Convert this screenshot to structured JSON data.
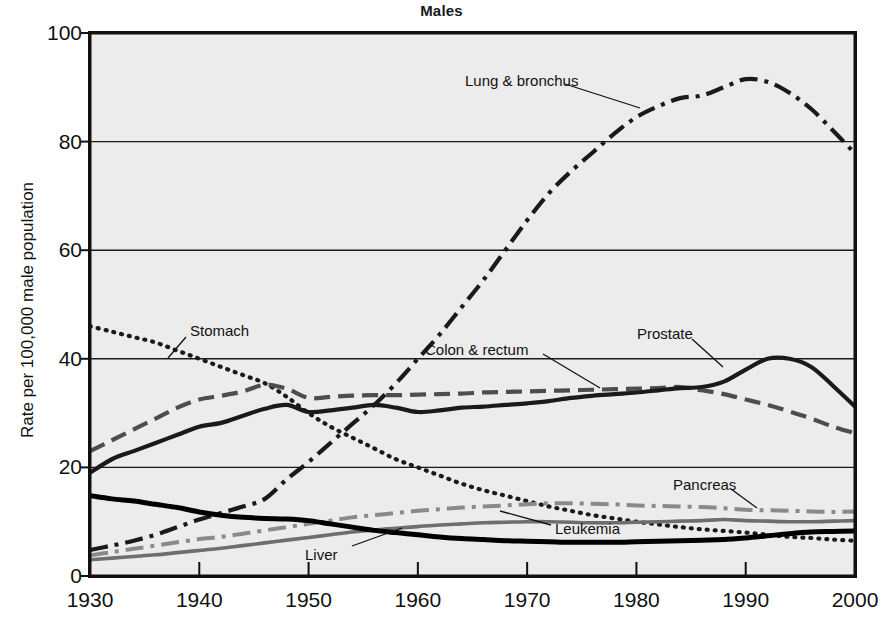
{
  "chart": {
    "title": "Males",
    "ylabel": "Rate per 100,000 male population",
    "xlabel": "",
    "background": "#ececec",
    "frame_color": "#111111"
  },
  "axis": {
    "y_ticks": [
      "0",
      "20",
      "40",
      "60",
      "80",
      "100"
    ],
    "x_ticks": [
      "1930",
      "1940",
      "1950",
      "1960",
      "1970",
      "1980",
      "1990",
      "2000"
    ]
  },
  "labels": {
    "lung": "Lung & bronchus",
    "stomach": "Stomach",
    "colon": "Colon & rectum",
    "prostate": "Prostate",
    "pancreas": "Pancreas",
    "leukemia": "Leukemia",
    "liver": "Liver"
  },
  "chart_data": {
    "type": "line",
    "title": "Males",
    "xlabel": "",
    "ylabel": "Rate per 100,000 male population",
    "xlim": [
      1930,
      2000
    ],
    "ylim": [
      0,
      100
    ],
    "grid": "horizontal",
    "legend": "inline-annotations",
    "x": [
      1930,
      1932,
      1934,
      1936,
      1938,
      1940,
      1942,
      1944,
      1946,
      1948,
      1950,
      1952,
      1954,
      1956,
      1958,
      1960,
      1962,
      1964,
      1966,
      1968,
      1970,
      1972,
      1974,
      1976,
      1978,
      1980,
      1982,
      1984,
      1986,
      1988,
      1990,
      1992,
      1994,
      1996,
      1998,
      2000
    ],
    "series": [
      {
        "name": "Lung & bronchus",
        "color": "#1a1a1a",
        "dash": "dash-dot",
        "width": 4.2,
        "values": [
          4.8,
          5.6,
          6.5,
          7.6,
          9.0,
          10.4,
          11.6,
          12.8,
          14.2,
          17.8,
          21.0,
          24.5,
          28.0,
          31.5,
          35.5,
          40.0,
          44.5,
          49.5,
          54.5,
          60.0,
          65.5,
          70.5,
          74.5,
          78.0,
          81.5,
          84.5,
          86.5,
          88.0,
          88.5,
          90.0,
          91.5,
          91.0,
          89.0,
          86.0,
          82.0,
          77.8
        ]
      },
      {
        "name": "Stomach",
        "color": "#1a1a1a",
        "dash": "dotted",
        "width": 4.2,
        "values": [
          46.0,
          45.0,
          44.0,
          43.0,
          41.5,
          40.0,
          38.5,
          37.0,
          35.5,
          33.0,
          30.0,
          27.5,
          25.5,
          23.5,
          21.5,
          20.0,
          18.5,
          17.0,
          15.8,
          14.8,
          13.8,
          12.8,
          12.0,
          11.2,
          10.6,
          10.0,
          9.5,
          9.0,
          8.6,
          8.3,
          8.0,
          7.6,
          7.2,
          7.0,
          6.7,
          6.5
        ]
      },
      {
        "name": "Colon & rectum",
        "color": "#4d4d4d",
        "dash": "long-dash",
        "width": 4.2,
        "values": [
          23.0,
          25.0,
          27.0,
          29.0,
          31.0,
          32.5,
          33.2,
          34.0,
          35.2,
          34.5,
          32.8,
          33.0,
          33.2,
          33.3,
          33.3,
          33.4,
          33.5,
          33.6,
          33.8,
          33.9,
          34.0,
          34.1,
          34.2,
          34.3,
          34.4,
          34.5,
          34.6,
          34.8,
          34.2,
          33.5,
          32.5,
          31.5,
          30.3,
          29.0,
          27.5,
          26.3
        ]
      },
      {
        "name": "Prostate",
        "color": "#1a1a1a",
        "dash": "solid",
        "width": 4.2,
        "values": [
          19.0,
          21.5,
          23.0,
          24.5,
          26.0,
          27.5,
          28.2,
          29.5,
          30.8,
          31.5,
          30.2,
          30.5,
          31.0,
          31.5,
          31.0,
          30.2,
          30.5,
          31.0,
          31.2,
          31.5,
          31.8,
          32.2,
          32.8,
          33.2,
          33.5,
          33.8,
          34.2,
          34.6,
          34.8,
          35.8,
          38.0,
          40.0,
          40.0,
          38.5,
          35.0,
          31.2
        ]
      },
      {
        "name": "Pancreas",
        "color": "#8a8a8a",
        "dash": "dash-dot",
        "width": 4.0,
        "values": [
          3.8,
          4.4,
          5.0,
          5.6,
          6.2,
          6.8,
          7.2,
          7.8,
          8.4,
          9.0,
          9.6,
          10.2,
          10.8,
          11.2,
          11.6,
          12.0,
          12.3,
          12.6,
          12.8,
          13.0,
          13.2,
          13.4,
          13.4,
          13.3,
          13.2,
          13.0,
          12.9,
          12.8,
          12.7,
          12.5,
          12.2,
          12.1,
          12.0,
          11.9,
          11.8,
          11.9
        ]
      },
      {
        "name": "Leukemia",
        "color": "#6e6e6e",
        "dash": "solid",
        "width": 3.6,
        "values": [
          3.0,
          3.3,
          3.6,
          3.9,
          4.3,
          4.7,
          5.1,
          5.6,
          6.1,
          6.6,
          7.1,
          7.6,
          8.1,
          8.5,
          8.8,
          9.1,
          9.4,
          9.6,
          9.8,
          9.9,
          10.0,
          10.0,
          9.9,
          9.8,
          9.8,
          9.9,
          10.0,
          10.1,
          10.2,
          10.4,
          10.2,
          10.1,
          10.0,
          10.0,
          10.1,
          10.2
        ]
      },
      {
        "name": "Liver",
        "color": "#000000",
        "dash": "solid",
        "width": 5.0,
        "values": [
          14.8,
          14.2,
          13.8,
          13.2,
          12.6,
          11.8,
          11.2,
          10.8,
          10.6,
          10.5,
          10.2,
          9.6,
          9.0,
          8.4,
          8.0,
          7.6,
          7.2,
          6.9,
          6.7,
          6.5,
          6.4,
          6.3,
          6.2,
          6.2,
          6.2,
          6.3,
          6.4,
          6.5,
          6.6,
          6.7,
          7.0,
          7.4,
          7.8,
          8.1,
          8.2,
          8.3
        ]
      }
    ],
    "annotations": [
      {
        "text": "Lung & bronchus",
        "x": 1963,
        "y": 92
      },
      {
        "text": "Stomach",
        "x": 1936,
        "y": 51
      },
      {
        "text": "Colon & rectum",
        "x": 1963,
        "y": 43
      },
      {
        "text": "Prostate",
        "x": 1982,
        "y": 44
      },
      {
        "text": "Pancreas",
        "x": 1984,
        "y": 17
      },
      {
        "text": "Leukemia",
        "x": 1969,
        "y": 8
      },
      {
        "text": "Liver",
        "x": 1955,
        "y": 3
      }
    ]
  }
}
